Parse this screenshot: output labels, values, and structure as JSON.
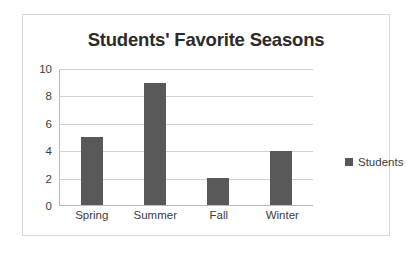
{
  "chart_data": {
    "type": "bar",
    "title": "Students' Favorite Seasons",
    "xlabel": "",
    "ylabel": "",
    "categories": [
      "Spring",
      "Summer",
      "Fall",
      "Winter"
    ],
    "values": [
      5,
      9,
      2,
      4
    ],
    "series": [
      {
        "name": "Students",
        "values": [
          5,
          9,
          2,
          4
        ]
      }
    ],
    "ylim": [
      0,
      10
    ],
    "ytick_labels": [
      "10",
      "8",
      "6",
      "4",
      "2",
      "0"
    ],
    "yticks": [
      10,
      8,
      6,
      4,
      2,
      0
    ],
    "grid": true,
    "legend": {
      "position": "right",
      "entries": [
        "Students"
      ]
    },
    "colors": {
      "bar": "#595959",
      "title": "#2b2b2b",
      "gridline": "#d0d0d0",
      "axis": "#b9b9b9",
      "border": "#d8d8d8",
      "background": "#ffffff",
      "tick_label": "#3d3d3d"
    }
  },
  "legend": {
    "label": "Students"
  }
}
